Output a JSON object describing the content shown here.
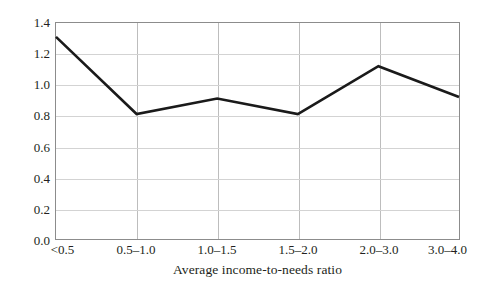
{
  "chart_data": {
    "type": "line",
    "title": "",
    "xlabel": "Average income-to-needs ratio",
    "ylabel": "Relative odds",
    "categories": [
      "<0.5",
      "0.5–1.0",
      "1.0–1.5",
      "1.5–2.0",
      "2.0–3.0",
      "3.0–4.0"
    ],
    "values": [
      1.31,
      0.81,
      0.91,
      0.81,
      1.12,
      0.92
    ],
    "series": [
      {
        "name": "Relative odds",
        "values": [
          1.31,
          0.81,
          0.91,
          0.81,
          1.12,
          0.92
        ]
      }
    ],
    "ylim": [
      0.0,
      1.4
    ],
    "yticks": [
      "0.0",
      "0.2",
      "0.4",
      "0.6",
      "0.8",
      "1.0",
      "1.2",
      "1.4"
    ],
    "ytick_values": [
      0.0,
      0.2,
      0.4,
      0.6,
      0.8,
      1.0,
      1.2,
      1.4
    ],
    "grid": "both",
    "legend": "none",
    "line_color": "#1a1a1a",
    "grid_color": "#d3d3d3",
    "vgrid_color": "#bdbdbd",
    "frame_color": "#8c8c8c",
    "background": "#ffffff"
  }
}
